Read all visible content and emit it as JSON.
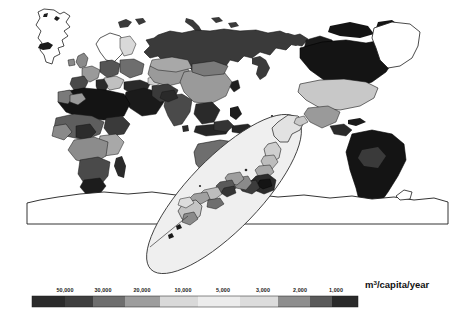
{
  "figure": {
    "type": "choropleth-world-map",
    "title": "",
    "unit_label": "m",
    "unit_label_sup": "3",
    "unit_label_rest": "/capita/year",
    "unit_label_full": "m3/capita/year"
  },
  "legend": {
    "name": "water-resources-colorbar",
    "orientation": "horizontal",
    "tick_labels": [
      "50,000",
      "30,000",
      "20,000",
      "10,000",
      "5,000",
      "3,000",
      "2,000",
      "1,000"
    ],
    "tick_values": [
      50000,
      30000,
      20000,
      10000,
      5000,
      3000,
      2000,
      1000
    ],
    "swatch_colors": [
      "#2b2b2b",
      "#3f3f3f",
      "#6e6e6e",
      "#9d9d9d",
      "#d9d9d9",
      "#eeeeee",
      "#dcdcdc",
      "#8e8e8e",
      "#5a5a5a",
      "#2a2a2a"
    ],
    "bar_x": 32,
    "bar_y": 296,
    "bar_width": 326,
    "bar_height": 11
  },
  "map": {
    "name": "world-map",
    "projection": "pacific-centred-cylindrical",
    "background": "#ffffff",
    "outline_color": "#1a1a1a",
    "inset": {
      "name": "japan-inset-ellipse",
      "region": "Japan",
      "fill": "#efefef",
      "stroke": "#333333"
    },
    "regions": [
      {
        "name": "greenland",
        "shade": "#ffffff"
      },
      {
        "name": "iceland",
        "shade": "#1e1e1e"
      },
      {
        "name": "scandinavia",
        "shade": "#ffffff"
      },
      {
        "name": "russia",
        "shade": "#3a3a3a"
      },
      {
        "name": "europe",
        "shade": "#8a8a8a"
      },
      {
        "name": "north-africa",
        "shade": "#1a1a1a"
      },
      {
        "name": "sub-saharan-africa",
        "shade": "#5e5e5e"
      },
      {
        "name": "middle-east",
        "shade": "#1a1a1a"
      },
      {
        "name": "india",
        "shade": "#4a4a4a"
      },
      {
        "name": "china",
        "shade": "#9a9a9a"
      },
      {
        "name": "southeast-asia",
        "shade": "#2a2a2a"
      },
      {
        "name": "australia",
        "shade": "#6e6e6e"
      },
      {
        "name": "new-zealand",
        "shade": "#2a2a2a"
      },
      {
        "name": "canada",
        "shade": "#1a1a1a"
      },
      {
        "name": "united-states",
        "shade": "#c8c8c8"
      },
      {
        "name": "mexico-central-america",
        "shade": "#8a8a8a"
      },
      {
        "name": "south-america",
        "shade": "#1a1a1a"
      },
      {
        "name": "antarctica",
        "shade": "#ffffff"
      },
      {
        "name": "japan-prefectures",
        "shade": "#777777"
      }
    ]
  }
}
